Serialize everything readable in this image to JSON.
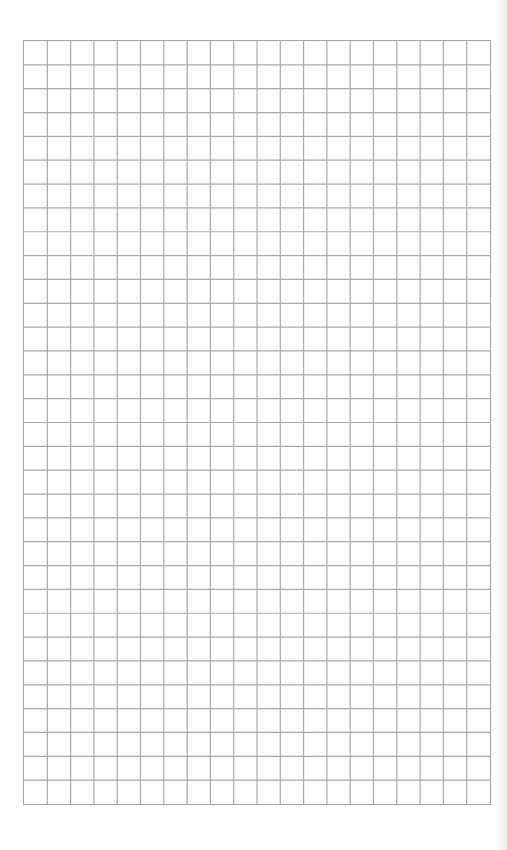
{
  "document": {
    "type": "graph-paper",
    "columns": 20,
    "rows": 32,
    "line_color": "#a8a8a8",
    "border_color": "#a3a3a3",
    "background_color": "#ffffff"
  }
}
